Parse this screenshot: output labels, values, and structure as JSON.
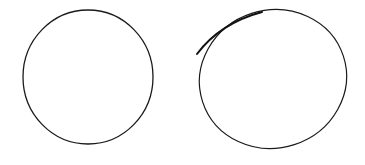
{
  "figure": {
    "background": "#ffffff",
    "stroke_color": "#1a1a1a",
    "shapes": [
      {
        "kind": "circle",
        "label": "round-circle",
        "cx": 88,
        "cy": 77,
        "rx": 65,
        "ry": 67,
        "rotate": 0
      },
      {
        "kind": "ellipse",
        "label": "hand-drawn-ellipse",
        "cx": 273,
        "cy": 79,
        "rx": 74,
        "ry": 69,
        "rotate": -18
      }
    ]
  }
}
